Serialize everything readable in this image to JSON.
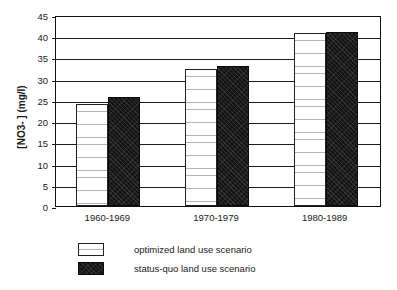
{
  "chart_data": {
    "type": "bar",
    "title": "",
    "subtitle": "",
    "xlabel": "",
    "ylabel": "[NO3- ]  (mg/l)",
    "categories": [
      "1960-1969",
      "1970-1979",
      "1980-1989"
    ],
    "series": [
      {
        "name": "optimized land use scenario",
        "values": [
          24.0,
          32.2,
          40.7
        ],
        "color": "#ffffff",
        "pattern": "wavy-horizontal-lines"
      },
      {
        "name": "status-quo land use scenario",
        "values": [
          25.7,
          32.9,
          41.0
        ],
        "color": "#141414",
        "pattern": "solid-black"
      }
    ],
    "ylim": [
      0,
      45
    ],
    "ytick_step": 5,
    "yticks": [
      "0",
      "5",
      "10",
      "15",
      "20",
      "25",
      "30",
      "35",
      "40",
      "45"
    ],
    "grid": "horizontal",
    "legend_position": "below-plot-left",
    "legend": [
      {
        "label": "optimized land use scenario",
        "swatch": "white-hatched"
      },
      {
        "label": "status-quo land use scenario",
        "swatch": "black-filled"
      }
    ]
  }
}
